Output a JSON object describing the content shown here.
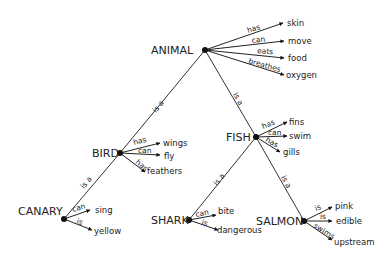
{
  "diagram": {
    "nodes": [
      {
        "id": "animal",
        "label": "ANIMAL",
        "x": 205,
        "y": 50,
        "lx": 151,
        "ly": 54
      },
      {
        "id": "bird",
        "label": "BIRD",
        "x": 120,
        "y": 153,
        "lx": 92,
        "ly": 157
      },
      {
        "id": "fish",
        "label": "FISH",
        "x": 256,
        "y": 137,
        "lx": 226,
        "ly": 141
      },
      {
        "id": "canary",
        "label": "CANARY",
        "x": 64,
        "y": 219,
        "lx": 18,
        "ly": 215
      },
      {
        "id": "shark",
        "label": "SHARK",
        "x": 189,
        "y": 220,
        "lx": 151,
        "ly": 224
      },
      {
        "id": "salmon",
        "label": "SALMON",
        "x": 304,
        "y": 221,
        "lx": 256,
        "ly": 225
      }
    ],
    "isa_edges": [
      {
        "from": "bird",
        "to": "animal",
        "label": "is a",
        "lx": 160,
        "ly": 108,
        "angle": -50
      },
      {
        "from": "fish",
        "to": "animal",
        "label": "is a",
        "lx": 236,
        "ly": 100,
        "angle": 62
      },
      {
        "from": "canary",
        "to": "bird",
        "label": "is a",
        "lx": 88,
        "ly": 184,
        "angle": -50
      },
      {
        "from": "shark",
        "to": "fish",
        "label": "is a",
        "lx": 221,
        "ly": 181,
        "angle": -52
      },
      {
        "from": "salmon",
        "to": "fish",
        "label": "is a",
        "lx": 284,
        "ly": 183,
        "angle": 62
      }
    ],
    "properties": [
      {
        "node": "animal",
        "rel": "has",
        "value": "skin",
        "tx": 283,
        "ty": 23,
        "vx": 287,
        "vy": 26,
        "rlx": 248,
        "rly": 33,
        "ra": -17
      },
      {
        "node": "animal",
        "rel": "can",
        "value": "move",
        "tx": 284,
        "ty": 41,
        "vx": 288,
        "vy": 44,
        "rlx": 252,
        "rly": 43,
        "ra": -6
      },
      {
        "node": "animal",
        "rel": "eats",
        "value": "food",
        "tx": 284,
        "ty": 58,
        "vx": 288,
        "vy": 61,
        "rlx": 257,
        "rly": 53,
        "ra": 5
      },
      {
        "node": "animal",
        "rel": "breathes",
        "value": "oxygen",
        "tx": 284,
        "ty": 75,
        "vx": 286,
        "vy": 78,
        "rlx": 248,
        "rly": 63,
        "ra": 16
      },
      {
        "node": "bird",
        "rel": "has",
        "value": "wings",
        "tx": 160,
        "ty": 143,
        "vx": 163,
        "vy": 146,
        "rlx": 134,
        "rly": 145,
        "ra": -14
      },
      {
        "node": "bird",
        "rel": "can",
        "value": "fly",
        "tx": 160,
        "ty": 155,
        "vx": 164,
        "vy": 159,
        "rlx": 138,
        "rly": 153,
        "ra": 0
      },
      {
        "node": "bird",
        "rel": "has",
        "value": "feathers",
        "tx": 145,
        "ty": 172,
        "vx": 147,
        "vy": 174,
        "rlx": 135,
        "rly": 163,
        "ra": 40
      },
      {
        "node": "fish",
        "rel": "has",
        "value": "fins",
        "tx": 287,
        "ty": 122,
        "vx": 289,
        "vy": 125,
        "rlx": 263,
        "rly": 129,
        "ra": -22
      },
      {
        "node": "fish",
        "rel": "can",
        "value": "swim",
        "tx": 287,
        "ty": 136,
        "vx": 289,
        "vy": 139,
        "rlx": 268,
        "rly": 135,
        "ra": 0
      },
      {
        "node": "fish",
        "rel": "has",
        "value": "gills",
        "tx": 280,
        "ty": 152,
        "vx": 283,
        "vy": 155,
        "rlx": 265,
        "rly": 141,
        "ra": 30
      },
      {
        "node": "canary",
        "rel": "can",
        "value": "sing",
        "tx": 90,
        "ty": 210,
        "vx": 95,
        "vy": 213,
        "rlx": 73,
        "rly": 212,
        "ra": -17
      },
      {
        "node": "canary",
        "rel": "is",
        "value": "yellow",
        "tx": 92,
        "ty": 230,
        "vx": 94,
        "vy": 234,
        "rlx": 76,
        "rly": 223,
        "ra": 22
      },
      {
        "node": "shark",
        "rel": "can",
        "value": "bite",
        "tx": 216,
        "ty": 215,
        "vx": 218,
        "vy": 214,
        "rlx": 196,
        "rly": 217,
        "ra": -12
      },
      {
        "node": "shark",
        "rel": "is",
        "value": "dangerous",
        "tx": 218,
        "ty": 230,
        "vx": 217,
        "vy": 233,
        "rlx": 201,
        "rly": 224,
        "ra": 22
      },
      {
        "node": "salmon",
        "rel": "is",
        "value": "pink",
        "tx": 332,
        "ty": 207,
        "vx": 335,
        "vy": 209,
        "rlx": 316,
        "rly": 211,
        "ra": -22
      },
      {
        "node": "salmon",
        "rel": "is",
        "value": "edible",
        "tx": 332,
        "ty": 221,
        "vx": 336,
        "vy": 224,
        "rlx": 320,
        "rly": 219,
        "ra": 0
      },
      {
        "node": "salmon",
        "rel": "swims",
        "value": "upstream",
        "tx": 332,
        "ty": 240,
        "vx": 334,
        "vy": 245,
        "rlx": 313,
        "rly": 227,
        "ra": 32
      }
    ]
  }
}
